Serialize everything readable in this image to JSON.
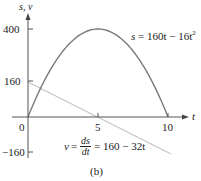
{
  "chart_data": {
    "type": "line",
    "title": "",
    "caption": "(b)",
    "xlabel": "t",
    "ylabel": "s, v",
    "xlim": [
      0,
      10.3
    ],
    "ylim": [
      -175,
      420
    ],
    "x_ticks": [
      0,
      5,
      10
    ],
    "x_tick_labels": [
      "0",
      "5",
      "10"
    ],
    "y_ticks": [
      400,
      160,
      -160
    ],
    "y_tick_labels": [
      "400",
      "160",
      "−160"
    ],
    "grid": false,
    "series": [
      {
        "name": "s = 160t − 16t²",
        "kind": "curve",
        "color": "#7a7a7a",
        "x": [
          0,
          1,
          2,
          3,
          4,
          5,
          6,
          7,
          8,
          9,
          10
        ],
        "values": [
          0,
          144,
          256,
          336,
          384,
          400,
          384,
          336,
          256,
          144,
          0
        ]
      },
      {
        "name": "v = ds/dt = 160 − 32t",
        "kind": "line",
        "color": "#c8c8c8",
        "x": [
          0,
          5,
          10.2
        ],
        "values": [
          160,
          0,
          -166
        ]
      }
    ],
    "annotations": [
      {
        "text": "s = 160t − 16t²",
        "near": "s curve, upper right"
      },
      {
        "text": "v = ds/dt = 160 − 32t",
        "near": "v line, lower middle"
      }
    ]
  },
  "labels": {
    "ylabel": "s, v",
    "xlabel": "t",
    "y400": "400",
    "y160": "160",
    "yneg160": "−160",
    "x0": "0",
    "x5": "5",
    "x10": "10",
    "s_eq_lhs": "s",
    "s_eq_rhs": "= 160t − 16t",
    "s_eq_exp": "2",
    "v_eq_lhs": "v",
    "v_eq_eq1": "=",
    "v_eq_num": "ds",
    "v_eq_den": "dt",
    "v_eq_rhs": "= 160 − 32t",
    "caption": "(b)"
  }
}
